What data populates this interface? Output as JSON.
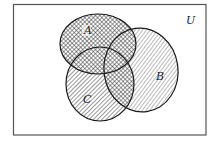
{
  "diagram": {
    "type": "venn",
    "universe": {
      "label": "U",
      "box": {
        "x": 13,
        "y": 4,
        "width": 193,
        "height": 131
      }
    },
    "sets": [
      {
        "id": "A",
        "label": "A",
        "shading": "crosshatch",
        "cx": 98,
        "cy": 44,
        "rx": 38,
        "ry": 30,
        "label_x": 84,
        "label_y": 34
      },
      {
        "id": "B",
        "label": "B",
        "shading": "diagonal-hatch",
        "cx": 141,
        "cy": 70,
        "rx": 37,
        "ry": 42,
        "label_x": 156,
        "label_y": 80
      },
      {
        "id": "C",
        "label": "C",
        "shading": "diagonal-hatch",
        "cx": 100,
        "cy": 84,
        "rx": 34,
        "ry": 37,
        "label_x": 83,
        "label_y": 103
      }
    ],
    "shaded_regions": {
      "crosshatch": [
        "A",
        "B∩C"
      ],
      "diagonal_hatch": [
        "B",
        "C"
      ]
    },
    "colors": {
      "stroke": "#1a1a1a",
      "hatch": "#333333",
      "background": "#ffffff",
      "border": "#555555"
    }
  }
}
